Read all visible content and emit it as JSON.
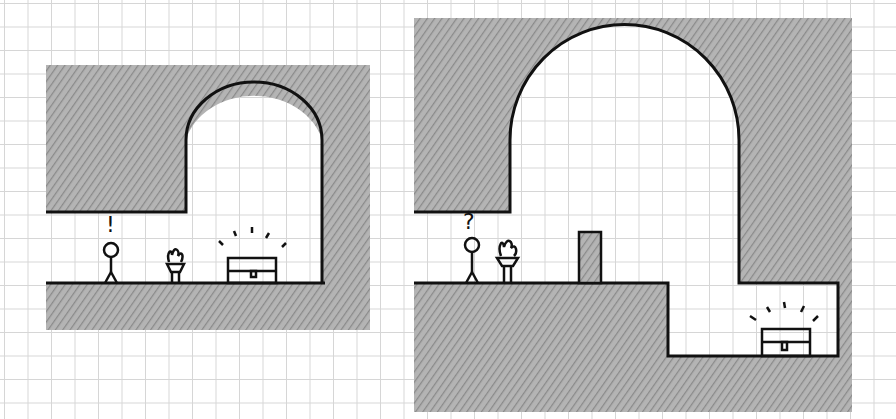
{
  "panels": [
    {
      "id": "left",
      "character_mark": "!",
      "description": "Stick figure notices a brazier and a glowing chest in a small arched room"
    },
    {
      "id": "right",
      "character_mark": "?",
      "description": "Stick figure, brazier, a pillar blocking the path, and a glowing chest in a lower pit under a large arch"
    }
  ],
  "colors": {
    "ink": "#111111",
    "shade": "#9a9a9a",
    "grid": "#d6d6d6",
    "paper": "#ffffff"
  }
}
